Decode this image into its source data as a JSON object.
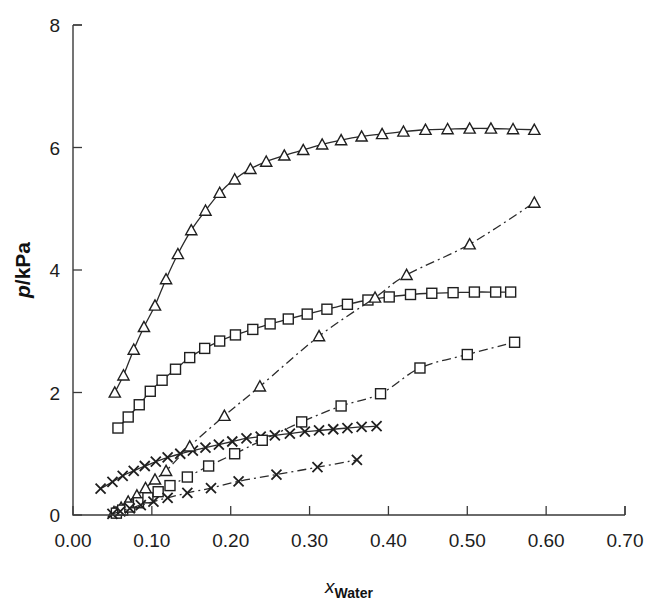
{
  "figure": {
    "background": "#ffffff",
    "ink_color": "#222222"
  },
  "chart_data": {
    "type": "line",
    "title": "",
    "subtitle": "",
    "xlabel": "x_Water",
    "xlabel_parts": {
      "symbol": "x",
      "subscript": "Water"
    },
    "ylabel": "p/kPa",
    "ylabel_parts": {
      "symbol": "p",
      "separator": "/",
      "unit": "kPa"
    },
    "xlim": [
      0.0,
      0.7
    ],
    "ylim": [
      0,
      8
    ],
    "xticks": [
      0.0,
      0.1,
      0.2,
      0.3,
      0.4,
      0.5,
      0.6,
      0.7
    ],
    "xticklabels": [
      "0.00",
      "0.10",
      "0.20",
      "0.30",
      "0.40",
      "0.50",
      "0.60",
      "0.70"
    ],
    "yticks": [
      0,
      2,
      4,
      6,
      8
    ],
    "yticklabels": [
      "0",
      "2",
      "4",
      "6",
      "8"
    ],
    "grid": false,
    "legend": "none",
    "legend_position": "none",
    "annotations": [],
    "series": [
      {
        "name": "triangle-solid",
        "marker": "triangle",
        "linestyle": "solid",
        "color": "#222222",
        "x": [
          0.053,
          0.064,
          0.077,
          0.09,
          0.104,
          0.118,
          0.133,
          0.15,
          0.168,
          0.186,
          0.205,
          0.225,
          0.245,
          0.268,
          0.292,
          0.316,
          0.34,
          0.366,
          0.392,
          0.419,
          0.447,
          0.475,
          0.503,
          0.53,
          0.558,
          0.585
        ],
        "y": [
          2.0,
          2.28,
          2.7,
          3.07,
          3.42,
          3.85,
          4.26,
          4.65,
          4.97,
          5.26,
          5.48,
          5.65,
          5.77,
          5.87,
          5.96,
          6.05,
          6.12,
          6.18,
          6.22,
          6.26,
          6.29,
          6.3,
          6.31,
          6.31,
          6.3,
          6.29
        ]
      },
      {
        "name": "square-solid",
        "marker": "square",
        "linestyle": "solid",
        "color": "#222222",
        "x": [
          0.057,
          0.07,
          0.084,
          0.098,
          0.113,
          0.13,
          0.148,
          0.167,
          0.186,
          0.206,
          0.228,
          0.25,
          0.273,
          0.297,
          0.322,
          0.348,
          0.374,
          0.401,
          0.428,
          0.455,
          0.482,
          0.509,
          0.536,
          0.555
        ],
        "y": [
          1.42,
          1.6,
          1.8,
          2.02,
          2.2,
          2.38,
          2.57,
          2.72,
          2.84,
          2.94,
          3.03,
          3.12,
          3.2,
          3.28,
          3.36,
          3.44,
          3.51,
          3.56,
          3.6,
          3.62,
          3.63,
          3.64,
          3.64,
          3.64
        ]
      },
      {
        "name": "cross-solid",
        "marker": "x",
        "linestyle": "solid",
        "color": "#222222",
        "x": [
          0.035,
          0.05,
          0.063,
          0.077,
          0.091,
          0.105,
          0.12,
          0.136,
          0.152,
          0.168,
          0.185,
          0.202,
          0.22,
          0.238,
          0.256,
          0.275,
          0.294,
          0.312,
          0.33,
          0.348,
          0.366,
          0.385
        ],
        "y": [
          0.43,
          0.54,
          0.64,
          0.72,
          0.8,
          0.87,
          0.94,
          1.0,
          1.05,
          1.1,
          1.15,
          1.2,
          1.25,
          1.28,
          1.3,
          1.33,
          1.36,
          1.38,
          1.4,
          1.42,
          1.44,
          1.45
        ]
      },
      {
        "name": "triangle-dashdot",
        "marker": "triangle",
        "linestyle": "dashdot",
        "color": "#222222",
        "x": [
          0.052,
          0.061,
          0.07,
          0.081,
          0.092,
          0.104,
          0.118,
          0.148,
          0.192,
          0.237,
          0.312,
          0.383,
          0.423,
          0.503,
          0.585
        ],
        "y": [
          0.05,
          0.12,
          0.22,
          0.32,
          0.44,
          0.58,
          0.72,
          1.12,
          1.62,
          2.1,
          2.92,
          3.55,
          3.92,
          4.42,
          5.1
        ]
      },
      {
        "name": "square-dashdot",
        "marker": "square",
        "linestyle": "dashdot",
        "color": "#222222",
        "x": [
          0.055,
          0.063,
          0.072,
          0.083,
          0.095,
          0.108,
          0.123,
          0.145,
          0.172,
          0.205,
          0.24,
          0.29,
          0.34,
          0.39,
          0.44,
          0.5,
          0.56
        ],
        "y": [
          0.03,
          0.08,
          0.13,
          0.2,
          0.28,
          0.38,
          0.48,
          0.62,
          0.8,
          1.0,
          1.22,
          1.52,
          1.78,
          1.98,
          2.4,
          2.62,
          2.82
        ]
      },
      {
        "name": "cross-dashdot",
        "marker": "x",
        "linestyle": "dashdot",
        "color": "#222222",
        "x": [
          0.05,
          0.06,
          0.072,
          0.086,
          0.102,
          0.12,
          0.145,
          0.175,
          0.21,
          0.258,
          0.31,
          0.36
        ],
        "y": [
          0.02,
          0.06,
          0.11,
          0.16,
          0.22,
          0.28,
          0.36,
          0.44,
          0.55,
          0.66,
          0.78,
          0.9
        ]
      }
    ]
  }
}
